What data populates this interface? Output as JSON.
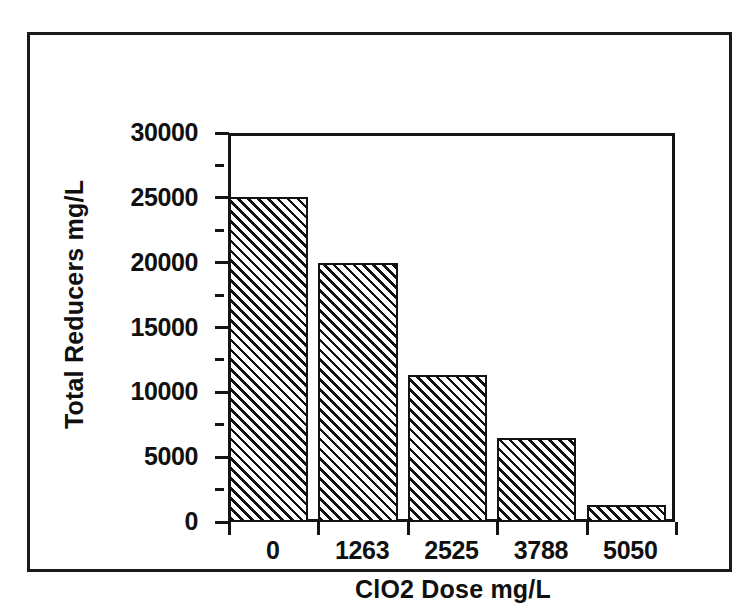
{
  "figure": {
    "background_color": "#ffffff",
    "ink_color": "#121212",
    "border_color": "#1a1a1a"
  },
  "chart_data": {
    "type": "bar",
    "title": "",
    "subtitle": "",
    "xlabel": "ClO2 Dose   mg/L",
    "ylabel": "Total  Reducers   mg/L",
    "categories": [
      "0",
      "1263",
      "2525",
      "3788",
      "5050"
    ],
    "values": [
      25100,
      20000,
      11300,
      6500,
      1300
    ],
    "ylim": [
      0,
      30000
    ],
    "ytick_labels": [
      "0",
      "5000",
      "10000",
      "15000",
      "20000",
      "25000",
      "30000"
    ],
    "ytick_values": [
      0,
      5000,
      10000,
      15000,
      20000,
      25000,
      30000
    ],
    "yminor_tick_values": [
      2500,
      7500,
      12500,
      17500,
      22500,
      27500
    ],
    "xtick_labels": [
      "0",
      "1263",
      "2525",
      "3788",
      "5050"
    ],
    "grid": false,
    "legend": null,
    "legend_position": "none",
    "bar_fill": "diagonal-hatch-45",
    "annotations": []
  }
}
